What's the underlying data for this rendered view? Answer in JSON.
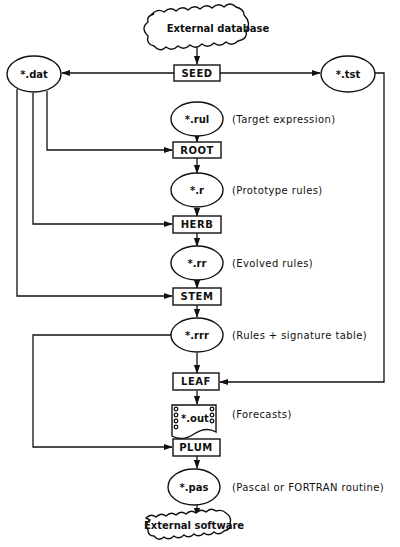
{
  "diagram": {
    "type": "flowchart",
    "top_source": {
      "label": "External database",
      "shape": "cloud"
    },
    "bottom_sink": {
      "label": "External software",
      "shape": "cloud"
    },
    "processes": {
      "seed": "SEED",
      "root": "ROOT",
      "herb": "HERB",
      "stem": "STEM",
      "leaf": "LEAF",
      "plum": "PLUM"
    },
    "files": {
      "dat": {
        "label": "*.dat"
      },
      "tst": {
        "label": "*.tst"
      },
      "rul": {
        "label": "*.rul",
        "description": "(Target expression)"
      },
      "r": {
        "label": "*.r",
        "description": "(Prototype rules)"
      },
      "rr": {
        "label": "*.rr",
        "description": "(Evolved rules)"
      },
      "rrr": {
        "label": "*.rrr",
        "description": "(Rules + signature table)"
      },
      "out": {
        "label": "*.out",
        "description": "(Forecasts)",
        "shape": "document"
      },
      "pas": {
        "label": "*.pas",
        "description": "(Pascal or FORTRAN routine)"
      }
    },
    "edges": [
      [
        "External database",
        "SEED"
      ],
      [
        "SEED",
        "*.dat"
      ],
      [
        "SEED",
        "*.tst"
      ],
      [
        "*.rul",
        "ROOT"
      ],
      [
        "*.dat",
        "ROOT"
      ],
      [
        "ROOT",
        "*.r"
      ],
      [
        "*.r",
        "HERB"
      ],
      [
        "*.dat",
        "HERB"
      ],
      [
        "HERB",
        "*.rr"
      ],
      [
        "*.rr",
        "STEM"
      ],
      [
        "*.dat",
        "STEM"
      ],
      [
        "STEM",
        "*.rrr"
      ],
      [
        "*.rrr",
        "LEAF"
      ],
      [
        "*.tst",
        "LEAF"
      ],
      [
        "LEAF",
        "*.out"
      ],
      [
        "*.rrr",
        "PLUM"
      ],
      [
        "PLUM",
        "*.pas"
      ],
      [
        "*.pas",
        "External software"
      ]
    ],
    "colors": {
      "line": "#111111",
      "background": "#ffffff"
    }
  }
}
